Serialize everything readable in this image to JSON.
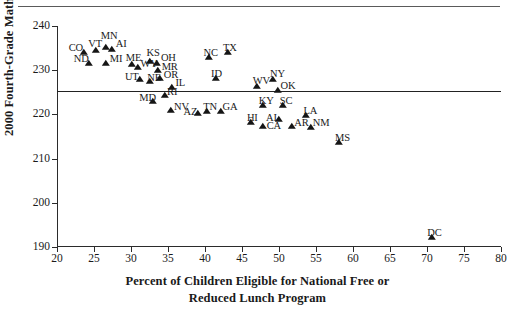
{
  "chart_data": {
    "type": "scatter",
    "title": "",
    "xlabel": "Percent of Children Eligible for National Free or Reduced Lunch Program",
    "xlabel_line1": "Percent of Children Eligible for National Free or",
    "xlabel_line2": "Reduced Lunch Program",
    "ylabel": "2000 Fourth-Grade Math Score",
    "xlim": [
      20,
      80
    ],
    "ylim": [
      190,
      240
    ],
    "xticks": [
      20,
      25,
      30,
      35,
      40,
      45,
      50,
      55,
      60,
      65,
      70,
      75,
      80
    ],
    "yticks": [
      190,
      200,
      210,
      220,
      230,
      240
    ],
    "grid": false,
    "legend": "none",
    "marker": "triangle",
    "marker_color": "#151515",
    "reference_line": {
      "orientation": "horizontal",
      "y": 225.3,
      "label": ""
    },
    "points": [
      {
        "label": "CO",
        "x": 23.6,
        "y": 233.5,
        "lx": -15,
        "ly": -12
      },
      {
        "label": "ND",
        "x": 24.3,
        "y": 231.0,
        "lx": -15,
        "ly": -12
      },
      {
        "label": "VT",
        "x": 25.3,
        "y": 233.9,
        "lx": -8,
        "ly": -14
      },
      {
        "label": "MN",
        "x": 26.6,
        "y": 234.6,
        "lx": -5,
        "ly": -19
      },
      {
        "label": "AI",
        "x": 27.4,
        "y": 234.2,
        "lx": 4,
        "ly": -13
      },
      {
        "label": "MI",
        "x": 26.6,
        "y": 231.0,
        "lx": 4,
        "ly": -12
      },
      {
        "label": "ME",
        "x": 30.1,
        "y": 230.7,
        "lx": -6,
        "ly": -14
      },
      {
        "label": "WY",
        "x": 31.0,
        "y": 230.0,
        "lx": 2,
        "ly": -11
      },
      {
        "label": "KS",
        "x": 32.5,
        "y": 231.5,
        "lx": -3,
        "ly": -16
      },
      {
        "label": "OH",
        "x": 33.5,
        "y": 231.0,
        "lx": 4,
        "ly": -13
      },
      {
        "label": "MR",
        "x": 33.6,
        "y": 229.4,
        "lx": 4,
        "ly": -11
      },
      {
        "label": "OR",
        "x": 33.9,
        "y": 227.6,
        "lx": 4,
        "ly": -11
      },
      {
        "label": "UT",
        "x": 31.2,
        "y": 227.3,
        "lx": -15,
        "ly": -10
      },
      {
        "label": "NE",
        "x": 32.6,
        "y": 226.8,
        "lx": -3,
        "ly": -11
      },
      {
        "label": "IL",
        "x": 35.6,
        "y": 225.5,
        "lx": 3,
        "ly": -12
      },
      {
        "label": "MD",
        "x": 33.0,
        "y": 222.3,
        "lx": -14,
        "ly": -11
      },
      {
        "label": "RI",
        "x": 34.6,
        "y": 223.7,
        "lx": 2,
        "ly": -11
      },
      {
        "label": "NV",
        "x": 35.4,
        "y": 220.3,
        "lx": 3,
        "ly": -11
      },
      {
        "label": "NC",
        "x": 40.6,
        "y": 232.2,
        "lx": -6,
        "ly": -12
      },
      {
        "label": "TX",
        "x": 43.1,
        "y": 233.5,
        "lx": -5,
        "ly": -12
      },
      {
        "label": "ID",
        "x": 41.5,
        "y": 227.5,
        "lx": -5,
        "ly": -12
      },
      {
        "label": "AZ",
        "x": 39.0,
        "y": 219.7,
        "lx": -14,
        "ly": -9
      },
      {
        "label": "TN",
        "x": 40.3,
        "y": 220.0,
        "lx": -4,
        "ly": -12
      },
      {
        "label": "GA",
        "x": 42.1,
        "y": 220.0,
        "lx": 2,
        "ly": -12
      },
      {
        "label": "WV",
        "x": 47.0,
        "y": 225.7,
        "lx": -4,
        "ly": -13
      },
      {
        "label": "NY",
        "x": 49.2,
        "y": 227.4,
        "lx": -3,
        "ly": -13
      },
      {
        "label": "KY",
        "x": 47.8,
        "y": 221.5,
        "lx": -4,
        "ly": -12
      },
      {
        "label": "OK",
        "x": 49.8,
        "y": 224.9,
        "lx": 3,
        "ly": -12
      },
      {
        "label": "SC",
        "x": 50.5,
        "y": 221.5,
        "lx": -3,
        "ly": -12
      },
      {
        "label": "HI",
        "x": 46.2,
        "y": 217.5,
        "lx": -4,
        "ly": -12
      },
      {
        "label": "AI",
        "x": 50.0,
        "y": 218.3,
        "lx": -13,
        "ly": -9
      },
      {
        "label": "CA",
        "x": 47.8,
        "y": 216.7,
        "lx": 4,
        "ly": -8
      },
      {
        "label": "LA",
        "x": 53.7,
        "y": 219.2,
        "lx": -3,
        "ly": -12
      },
      {
        "label": "AR",
        "x": 51.8,
        "y": 216.8,
        "lx": 2,
        "ly": -11
      },
      {
        "label": "NM",
        "x": 54.3,
        "y": 216.5,
        "lx": 2,
        "ly": -12
      },
      {
        "label": "MS",
        "x": 58.1,
        "y": 213.0,
        "lx": -4,
        "ly": -12
      },
      {
        "label": "DC",
        "x": 70.7,
        "y": 191.6,
        "lx": -5,
        "ly": -12
      }
    ]
  }
}
